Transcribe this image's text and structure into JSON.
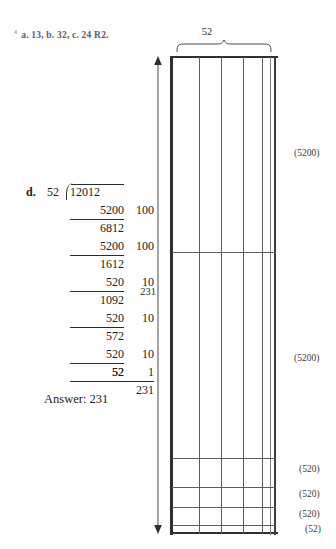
{
  "header": {
    "marker": "4",
    "text": "a. 13, b. 32, c. 24 R2."
  },
  "division": {
    "item_label": "d.",
    "divisor": "52",
    "dividend": "12012",
    "steps": [
      {
        "subtrahend": "5200",
        "partial_quotient": "100",
        "remainder": "6812"
      },
      {
        "subtrahend": "5200",
        "partial_quotient": "100",
        "remainder": "1612"
      },
      {
        "subtrahend": "520",
        "partial_quotient": "10",
        "remainder": "1092"
      },
      {
        "subtrahend": "520",
        "partial_quotient": "10",
        "remainder": "572"
      },
      {
        "subtrahend": "520",
        "partial_quotient": "10",
        "remainder": "52"
      },
      {
        "subtrahend": "52",
        "partial_quotient": "1",
        "remainder": ""
      }
    ],
    "quotient_total": "231",
    "answer_text": "Answer: 231"
  },
  "model": {
    "width_label": "52",
    "height_label": "231",
    "band_labels": [
      {
        "text": "(5200)"
      },
      {
        "text": "(5200)"
      },
      {
        "text": "(520)"
      },
      {
        "text": "(520)"
      },
      {
        "text": "(520)"
      },
      {
        "text": "(52)"
      }
    ]
  }
}
